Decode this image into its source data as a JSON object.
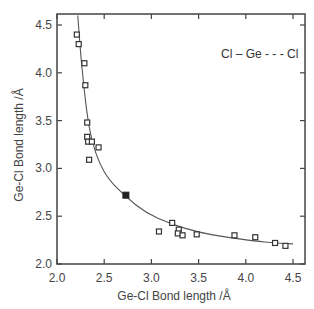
{
  "chart_data": {
    "type": "scatter",
    "title": "",
    "xlabel": "Ge-Cl Bond length /Å",
    "ylabel": "Ge-Cl Bond length /Å",
    "xlim": [
      2.0,
      4.6
    ],
    "ylim": [
      2.0,
      4.6
    ],
    "xticks": [
      "2.0",
      "2.5",
      "3.0",
      "3.5",
      "4.0",
      "4.5"
    ],
    "yticks": [
      "2.0",
      "2.5",
      "3.0",
      "3.5",
      "4.0",
      "4.5"
    ],
    "grid": false,
    "annotation": "Cl – Ge - - - Cl",
    "series": [
      {
        "name": "observed (open squares)",
        "marker": "open-square",
        "points": [
          [
            2.21,
            4.4
          ],
          [
            2.23,
            4.3
          ],
          [
            2.29,
            4.1
          ],
          [
            2.3,
            3.87
          ],
          [
            2.32,
            3.48
          ],
          [
            2.32,
            3.33
          ],
          [
            2.33,
            3.28
          ],
          [
            2.37,
            3.28
          ],
          [
            2.44,
            3.22
          ],
          [
            2.34,
            3.09
          ],
          [
            3.08,
            2.34
          ],
          [
            3.22,
            2.43
          ],
          [
            3.29,
            2.36
          ],
          [
            3.28,
            2.32
          ],
          [
            3.33,
            2.3
          ],
          [
            3.48,
            2.31
          ],
          [
            3.88,
            2.3
          ],
          [
            4.1,
            2.28
          ],
          [
            4.31,
            2.22
          ],
          [
            4.42,
            2.19
          ]
        ]
      },
      {
        "name": "symmetric (filled square)",
        "marker": "filled-square",
        "points": [
          [
            2.73,
            2.72
          ]
        ]
      },
      {
        "name": "fit curve",
        "marker": "line",
        "points": [
          [
            2.22,
            4.6
          ],
          [
            2.25,
            4.2
          ],
          [
            2.28,
            3.9
          ],
          [
            2.32,
            3.55
          ],
          [
            2.37,
            3.28
          ],
          [
            2.45,
            3.05
          ],
          [
            2.55,
            2.88
          ],
          [
            2.73,
            2.7
          ],
          [
            2.95,
            2.53
          ],
          [
            3.2,
            2.42
          ],
          [
            3.5,
            2.33
          ],
          [
            3.8,
            2.28
          ],
          [
            4.1,
            2.24
          ],
          [
            4.3,
            2.22
          ],
          [
            4.5,
            2.21
          ]
        ]
      }
    ]
  }
}
